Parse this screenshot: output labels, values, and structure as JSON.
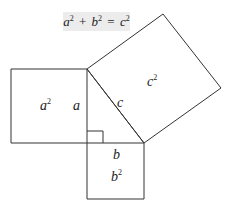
{
  "equation": {
    "a": "a",
    "a_exp": "2",
    "plus": "+",
    "b": "b",
    "b_exp": "2",
    "equals": "=",
    "c": "c",
    "c_exp": "2"
  },
  "labels": {
    "square_a": {
      "base": "a",
      "exp": "2"
    },
    "side_a": "a",
    "side_c": "c",
    "square_c": {
      "base": "c",
      "exp": "2"
    },
    "side_b": "b",
    "square_b": {
      "base": "b",
      "exp": "2"
    }
  },
  "colors": {
    "stroke": "#333333",
    "equation_background": "#ececec"
  }
}
